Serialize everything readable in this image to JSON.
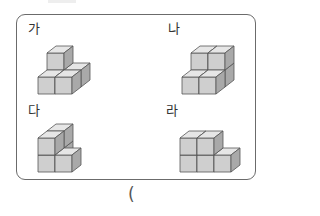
{
  "question": {
    "options": [
      {
        "label": "가",
        "cubes": [
          [
            0,
            0,
            0
          ],
          [
            1,
            0,
            0
          ],
          [
            1,
            1,
            0
          ],
          [
            0,
            1,
            0
          ],
          [
            0,
            1,
            1
          ]
        ]
      },
      {
        "label": "나",
        "cubes": [
          [
            0,
            1,
            0
          ],
          [
            1,
            1,
            0
          ],
          [
            0,
            1,
            1
          ],
          [
            1,
            1,
            1
          ],
          [
            0,
            0,
            0
          ],
          [
            1,
            0,
            0
          ]
        ]
      },
      {
        "label": "다",
        "cubes": [
          [
            0,
            0,
            0
          ],
          [
            0,
            0,
            1
          ],
          [
            0,
            1,
            0
          ],
          [
            0,
            1,
            1
          ],
          [
            1,
            0,
            0
          ]
        ]
      },
      {
        "label": "라",
        "cubes": [
          [
            0,
            0,
            0
          ],
          [
            1,
            0,
            0
          ],
          [
            2,
            0,
            0
          ],
          [
            0,
            0,
            1
          ],
          [
            1,
            0,
            1
          ]
        ]
      }
    ],
    "answer_prefix": "("
  },
  "colors": {
    "frame": "#6b6b6b",
    "cube_top": "#e6e6e6",
    "cube_front": "#cfcfcf",
    "cube_side": "#a9a9a9",
    "cube_edge": "#555555"
  }
}
